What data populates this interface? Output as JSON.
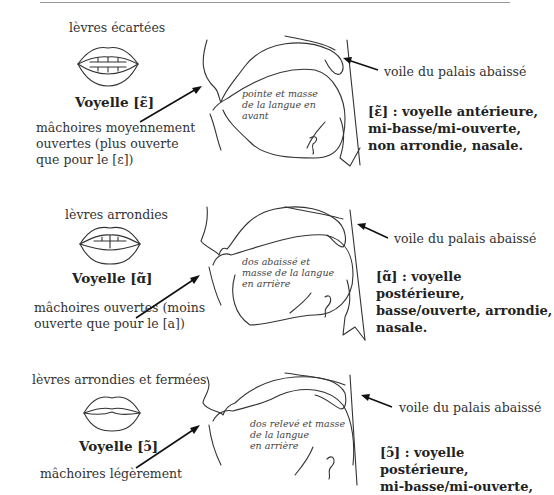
{
  "page": {
    "top_rule": true
  },
  "panels": [
    {
      "lips_label": "lèvres écartées",
      "lips_shape": "spread",
      "vowel_title": "Voyelle [ɛ̃]",
      "jaw": [
        "mâchoires moyennement",
        "ouvertes (plus ouverte",
        "que pour le [ɛ])"
      ],
      "tongue": [
        "pointe et masse",
        "de la langue en",
        "avant"
      ],
      "velum_label": "voile du palais abaissé",
      "description": [
        "[ɛ̃] : voyelle antérieure,",
        "mi-basse/mi-ouverte,",
        "non arrondie, nasale."
      ]
    },
    {
      "lips_label": "lèvres arrondies",
      "lips_shape": "rounded",
      "vowel_title": "Voyelle [ɑ̃]",
      "jaw": [
        "mâchoires ouvertes (moins",
        "ouverte que pour le [a])"
      ],
      "tongue": [
        "dos abaissé et",
        "masse de la langue",
        "en arrière"
      ],
      "velum_label": "voile du palais abaissé",
      "description": [
        "[ɑ̃] : voyelle postérieure,",
        "basse/ouverte, arrondie,",
        "nasale."
      ]
    },
    {
      "lips_label": "lèvres arrondies et fermées",
      "lips_shape": "rounded-closed",
      "vowel_title": "Voyelle [ɔ̃]",
      "jaw": [
        "mâchoires légèrement"
      ],
      "tongue": [
        "dos relevé et masse",
        "de la langue",
        "en arrière"
      ],
      "velum_label": "voile du palais abaissé",
      "description": [
        "[ɔ̃] : voyelle postérieure,",
        "mi-basse/mi-ouverte,"
      ]
    }
  ]
}
